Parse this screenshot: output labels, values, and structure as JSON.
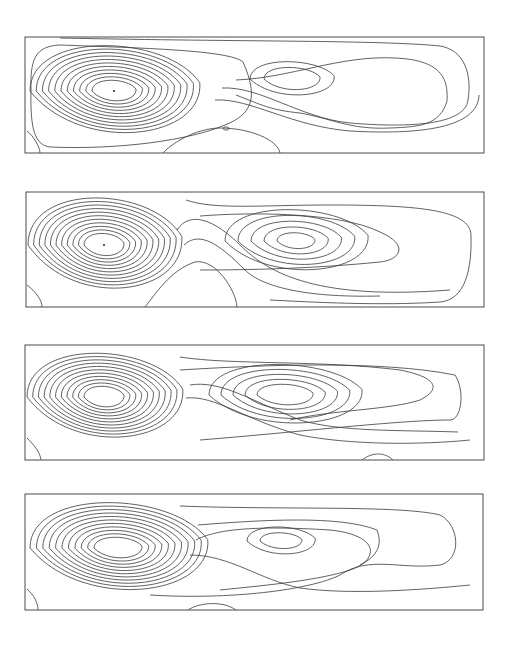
{
  "figure": {
    "line_color": "#3a3a3a",
    "frame_color": "#4a4a4a",
    "background": "#ffffff"
  },
  "panels": [
    {
      "id": "panel-1",
      "frame": {
        "x": 25,
        "y": 37,
        "w": 459,
        "h": 116
      },
      "vortices": [
        {
          "name": "left",
          "cx": 114,
          "cy": 91,
          "rings": 11,
          "rx0": 22,
          "ry0": 13,
          "drx": 6.2,
          "dry": 4.2,
          "center_dot": true
        },
        {
          "name": "right",
          "cx": 292,
          "cy": 79,
          "rings": 2,
          "rx0": 28,
          "ry0": 14,
          "drx": 14,
          "dry": 7,
          "center_dot": false
        }
      ],
      "paths": [
        "M 243 62 C 230 50, 140 48, 60 45 C 35 46, 30 60, 31 90 C 30 130, 35 145, 50 147 C 120 150, 190 140, 225 125 C 250 115, 260 100, 243 62",
        "M 236 80 C 290 78, 340 55, 395 58 C 445 60, 448 82, 447 101 C 440 125, 420 127, 390 128 C 350 130, 330 118, 300 113 C 270 110, 262 105, 236 95",
        "M 222 88 C 260 86, 300 118, 350 123 C 410 128, 465 125, 468 100 C 472 75, 465 50, 440 46 C 380 40, 250 42, 60 38",
        "M 215 100 C 250 98, 290 126, 350 131 C 420 135, 478 128, 479 95",
        "M 27 131 C 34 136, 40 148, 40 153",
        "M 163 153 C 175 140, 200 128, 220 128 C 250 128, 278 140, 280 153",
        "M 226 127 a 3 1.5 0 1 0 0.1 0"
      ]
    },
    {
      "id": "panel-2",
      "frame": {
        "x": 26,
        "y": 192,
        "w": 458,
        "h": 115
      },
      "vortices": [
        {
          "name": "left",
          "cx": 104,
          "cy": 245,
          "rings": 11,
          "rx0": 20,
          "ry0": 14,
          "drx": 5.6,
          "dry": 4.3,
          "center_dot": true
        },
        {
          "name": "right",
          "cx": 296,
          "cy": 241,
          "rings": 5,
          "rx0": 19,
          "ry0": 10,
          "drx": 13,
          "dry": 7,
          "center_dot": false
        }
      ],
      "paths": [
        "M 186 200 C 215 210, 260 205, 330 205 C 420 205, 470 210, 471 235 C 472 270, 465 300, 440 302 C 380 306, 310 302, 270 300",
        "M 200 216 C 250 212, 340 212, 380 232 C 410 245, 400 260, 380 262 C 320 268, 260 270, 200 270",
        "M 177 230 C 190 210, 215 220, 240 245 C 270 275, 320 300, 450 290",
        "M 184 245 C 200 230, 220 245, 245 270 C 260 285, 300 298, 380 296",
        "M 27 285 C 36 292, 42 300, 42 307",
        "M 145 307 C 155 295, 170 270, 195 262 C 215 258, 236 290, 237 307"
      ]
    },
    {
      "id": "panel-3",
      "frame": {
        "x": 25,
        "y": 345,
        "w": 459,
        "h": 115
      },
      "vortices": [
        {
          "name": "left",
          "cx": 104,
          "cy": 397,
          "rings": 11,
          "rx0": 20,
          "ry0": 13,
          "drx": 5.7,
          "dry": 4.0,
          "center_dot": false
        },
        {
          "name": "right",
          "cx": 285,
          "cy": 395,
          "rings": 5,
          "rx0": 28,
          "ry0": 13,
          "drx": 12,
          "dry": 6,
          "center_dot": false
        }
      ],
      "paths": [
        "M 180 357 C 230 365, 320 360, 400 370 C 440 378, 440 390, 420 400 C 390 410, 330 410, 290 420",
        "M 180 370 C 260 365, 380 360, 455 375 C 465 390, 462 420, 450 420 C 400 420, 300 432, 200 440",
        "M 190 385 C 220 380, 250 400, 300 420 C 340 432, 400 430, 458 432",
        "M 186 398 C 215 395, 245 420, 300 435 C 350 445, 420 445, 470 440",
        "M 27 438 C 34 445, 40 452, 41 460",
        "M 362 460 C 372 452, 385 452, 393 460"
      ]
    },
    {
      "id": "panel-4",
      "frame": {
        "x": 25,
        "y": 494,
        "w": 458,
        "h": 116
      },
      "vortices": [
        {
          "name": "left",
          "cx": 118,
          "cy": 548,
          "rings": 11,
          "rx0": 24,
          "ry0": 13,
          "drx": 6.4,
          "dry": 4.2,
          "center_dot": false
        },
        {
          "name": "right",
          "cx": 281,
          "cy": 541,
          "rings": 2,
          "rx0": 21,
          "ry0": 10,
          "drx": 13,
          "dry": 7,
          "center_dot": false
        }
      ],
      "paths": [
        "M 196 540 C 215 530, 250 525, 330 530 C 380 535, 380 560, 350 570 C 320 580, 270 585, 220 590",
        "M 198 525 C 260 520, 340 515, 377 530 C 385 550, 370 560, 360 565",
        "M 180 506 C 280 510, 400 505, 440 515 C 460 525, 462 560, 440 565 C 400 570, 370 555, 340 575 C 310 590, 230 600, 150 595",
        "M 190 555 C 230 555, 260 580, 300 588 C 350 595, 420 590, 470 585",
        "M 27 589 C 34 595, 38 603, 38 610",
        "M 188 610 C 198 603, 222 600, 236 610"
      ]
    }
  ]
}
